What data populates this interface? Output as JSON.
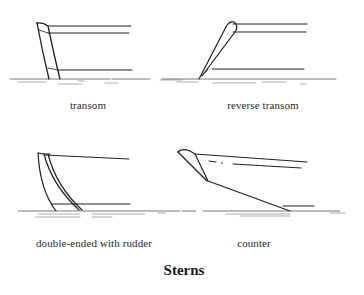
{
  "figure": {
    "title": "Sterns",
    "panels": [
      {
        "id": "transom",
        "label": "transom"
      },
      {
        "id": "reverse-transom",
        "label": "reverse transom"
      },
      {
        "id": "double-ended",
        "label": "double-ended with rudder"
      },
      {
        "id": "counter",
        "label": "counter"
      }
    ]
  }
}
